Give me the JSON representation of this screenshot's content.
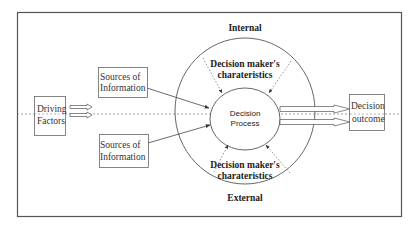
{
  "diagram": {
    "type": "decision-process-model",
    "colors": {
      "frame": "#555555",
      "line": "#555555",
      "dashed": "#777777",
      "text": "#222222"
    },
    "labels": {
      "internal": "Internal",
      "external": "External",
      "char_top_line1": "Decision maker's",
      "char_top_line2": "charateristics",
      "char_bottom_line1": "Decision maker's",
      "char_bottom_line2": "charateristics",
      "process_line1": "Decision",
      "process_line2": "Process"
    },
    "boxes": {
      "driving_factors": {
        "line1": "Driving",
        "line2": "Factors"
      },
      "sources_top": {
        "line1": "Sources of",
        "line2": "Information"
      },
      "sources_bottom": {
        "line1": "Sources of",
        "line2": "Information"
      },
      "decision_outcome": {
        "line1": "Decision",
        "line2": "outcome"
      }
    },
    "nodes": [
      "Driving Factors",
      "Sources of Information (top)",
      "Sources of Information (bottom)",
      "Decision Process",
      "Decision outcome"
    ],
    "edges": [
      {
        "from": "Driving Factors",
        "to": "Decision Process",
        "style": "double-hollow-arrow"
      },
      {
        "from": "Sources of Information (top)",
        "to": "Decision Process",
        "style": "solid-arrow"
      },
      {
        "from": "Sources of Information (bottom)",
        "to": "Decision Process",
        "style": "solid-arrow"
      },
      {
        "from": "Decision maker's charateristics (top)",
        "to": "Decision Process",
        "style": "dotted-arrow",
        "count": 2
      },
      {
        "from": "Decision maker's charateristics (bottom)",
        "to": "Decision Process",
        "style": "dotted-arrow",
        "count": 2
      },
      {
        "from": "Decision Process",
        "to": "Decision outcome",
        "style": "double-hollow-arrow"
      }
    ]
  }
}
